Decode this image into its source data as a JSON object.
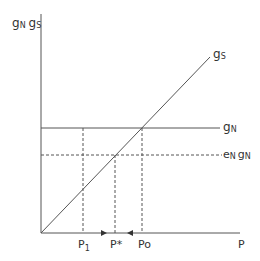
{
  "diagram": {
    "y_axis_label": {
      "g1": "g",
      "s1": "N",
      "g2": "g",
      "s2": "S"
    },
    "x_axis_label": "P",
    "curves": {
      "gs": {
        "main": "g",
        "sub": "S"
      },
      "gn": {
        "main": "g",
        "sub": "N"
      },
      "en_gn": {
        "e": "e",
        "e_sub": "N",
        "g": "g",
        "g_sub": "N"
      }
    },
    "x_ticks": {
      "p1": {
        "main": "P",
        "sub": "1"
      },
      "pstar": {
        "main": "P*"
      },
      "po": {
        "main": "Po"
      }
    },
    "colors": {
      "line": "#555555",
      "text": "#333333"
    }
  }
}
